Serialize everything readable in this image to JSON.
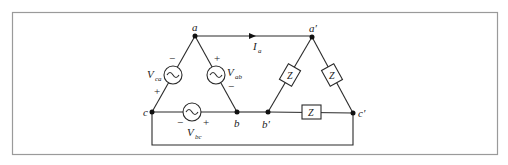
{
  "diagram": {
    "type": "circuit",
    "colors": {
      "wire": "#2a2a2a",
      "frame": "#9a9a9a",
      "background": "#ffffff"
    },
    "source_nodes": {
      "a": "a",
      "b": "b",
      "c": "c"
    },
    "load_nodes": {
      "a": "a′",
      "b": "b′",
      "c": "c′"
    },
    "sources": [
      {
        "id": "Vca",
        "label": "V",
        "subscript": "ca",
        "plus": "+",
        "minus": "−"
      },
      {
        "id": "Vab",
        "label": "V",
        "subscript": "ab",
        "plus": "+",
        "minus": "−"
      },
      {
        "id": "Vbc",
        "label": "V",
        "subscript": "bc",
        "plus": "+",
        "minus": "−"
      }
    ],
    "current": {
      "label": "I",
      "subscript": "a"
    },
    "impedances": [
      {
        "id": "Zab",
        "label": "Z"
      },
      {
        "id": "Zca",
        "label": "Z"
      },
      {
        "id": "Zbc",
        "label": "Z"
      }
    ],
    "source_glyph": "∼"
  }
}
